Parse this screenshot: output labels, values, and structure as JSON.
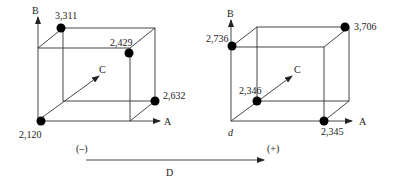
{
  "axes": {
    "a_label": "A",
    "b_label": "B",
    "c_label": "C",
    "d_label": "D",
    "origin_right_label": "d"
  },
  "d_scale": {
    "minus_label": "(–)",
    "plus_label": "(+)"
  },
  "left_cube": {
    "points": [
      {
        "label": "3,311",
        "corner": "back-top-left"
      },
      {
        "label": "2,429",
        "corner": "front-top-right"
      },
      {
        "label": "2,632",
        "corner": "back-bottom-right"
      },
      {
        "label": "2,120",
        "corner": "front-bottom-left"
      }
    ]
  },
  "right_cube": {
    "points": [
      {
        "label": "2,736",
        "corner": "front-top-left"
      },
      {
        "label": "3,706",
        "corner": "back-top-right"
      },
      {
        "label": "2,346",
        "corner": "back-bottom-left"
      },
      {
        "label": "2,345",
        "corner": "front-bottom-right"
      }
    ]
  },
  "colors": {
    "line": "#333333",
    "dot": "#000000",
    "text": "#222222"
  }
}
